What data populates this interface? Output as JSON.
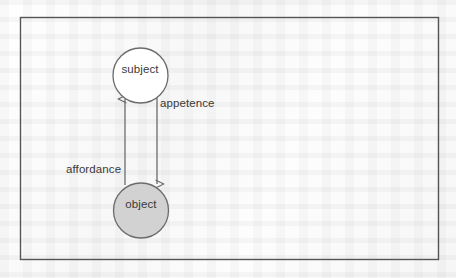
{
  "figure": {
    "type": "node-link-diagram",
    "frame": {
      "border_color": "#555555",
      "border_width": 1.4,
      "x": 20,
      "y": 17,
      "width": 418,
      "height": 242
    },
    "background_color": "#fbfbfb",
    "nodes": [
      {
        "id": "subject",
        "label": "subject",
        "shape": "circle",
        "cx": 140.5,
        "cy": 75.5,
        "r": 27.5,
        "fill": "#ffffff",
        "stroke": "#6b6b6b"
      },
      {
        "id": "object",
        "label": "object",
        "shape": "circle",
        "cx": 141,
        "cy": 210.5,
        "r": 27.5,
        "fill": "#d2d2d2",
        "stroke": "#6b6b6b"
      }
    ],
    "edges": [
      {
        "id": "affordance-edge",
        "label": "affordance",
        "from": "object",
        "to": "subject",
        "direction": "upward",
        "x": 125,
        "y_start": 185,
        "y_end": 97,
        "arrowhead": "at-subject",
        "stroke": "#6b6b6b"
      },
      {
        "id": "appetence-edge",
        "label": "appetence",
        "from": "subject",
        "to": "object",
        "direction": "downward",
        "x": 157,
        "y_start": 98,
        "y_end": 186,
        "arrowhead": "at-object",
        "stroke": "#6b6b6b"
      }
    ],
    "labels": {
      "subject": "subject",
      "object": "object",
      "appetence": "appetence",
      "affordance": "affordance"
    },
    "text_color": "#3a3a3a"
  }
}
